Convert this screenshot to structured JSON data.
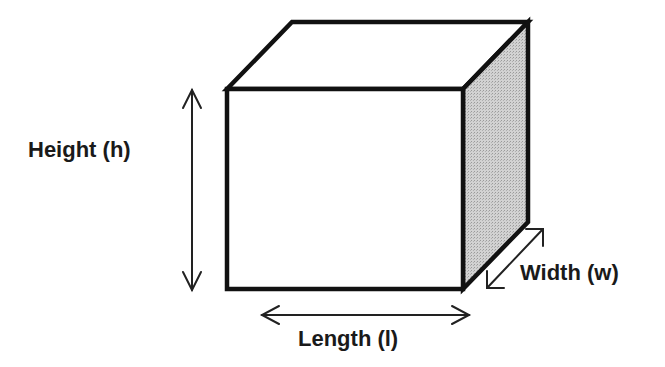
{
  "diagram": {
    "shape": "cuboid",
    "labels": {
      "height": "Height (h)",
      "length": "Length (l)",
      "width": "Width (w)"
    },
    "colors": {
      "outline": "#111111",
      "front_face": "#ffffff",
      "top_face": "#ffffff",
      "side_face": "#c8c8c8",
      "arrow": "#222222",
      "text": "#1a1a1a"
    }
  }
}
